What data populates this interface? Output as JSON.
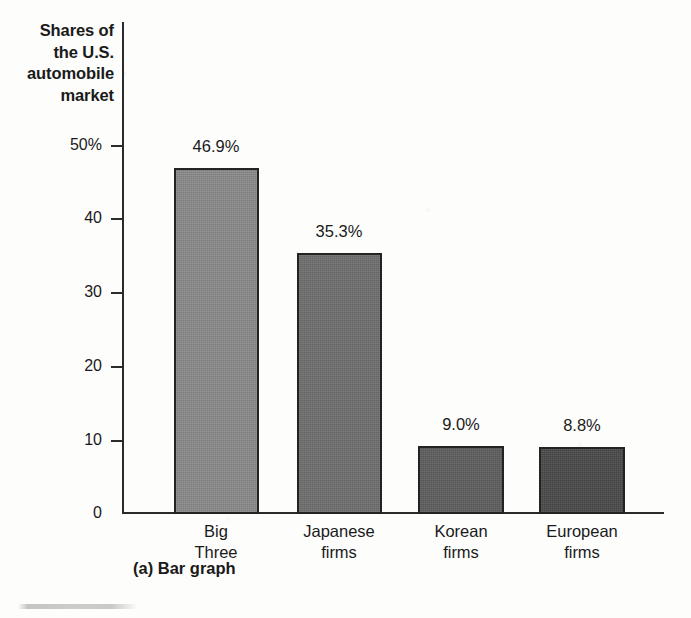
{
  "figure": {
    "caption": "(a) Bar graph",
    "axis_color": "#2b2b2b",
    "background_color": "#fdfdfc"
  },
  "chart_data": {
    "type": "bar",
    "title": "",
    "ylabel": "Shares of the U.S. automobile market",
    "ylabel_lines": [
      "Shares of",
      "the U.S.",
      "automobile",
      "market"
    ],
    "xlabel": "",
    "categories": [
      "Big Three",
      "Japanese firms",
      "Korean firms",
      "European firms"
    ],
    "category_lines": [
      [
        "Big",
        "Three"
      ],
      [
        "Japanese",
        "firms"
      ],
      [
        "Korean",
        "firms"
      ],
      [
        "European",
        "firms"
      ]
    ],
    "values": [
      46.9,
      35.3,
      9.0,
      8.8
    ],
    "value_labels": [
      "46.9%",
      "35.3%",
      "9.0%",
      "8.8%"
    ],
    "bar_colors": [
      "#8a8a8a",
      "#6e6e6e",
      "#5e5e5e",
      "#4a4a4a"
    ],
    "ylim": [
      0,
      50
    ],
    "yticks": [
      50,
      40,
      30,
      20,
      10,
      0
    ],
    "ytick_labels": [
      "50%",
      "40",
      "30",
      "20",
      "10",
      "0"
    ],
    "grid": false,
    "legend": null
  }
}
